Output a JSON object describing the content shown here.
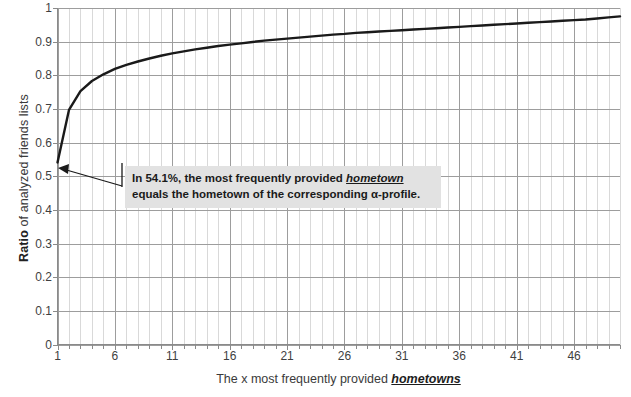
{
  "chart_data": {
    "type": "line",
    "title": "",
    "xlabel": "The x most frequently provided hometowns",
    "xlabel_plain": "The x most frequently provided ",
    "xlabel_emphasis": "hometowns",
    "ylabel": "Ratio of analyzed friends lists",
    "ylabel_bold": "Ratio",
    "ylabel_rest": " of analyzed friends lists",
    "xlim": [
      1,
      50
    ],
    "ylim": [
      0,
      1
    ],
    "grid": true,
    "legend": "none",
    "line_color": "#1a1a1a",
    "grid_color": "#9d9d9d",
    "minor_grid_color": "#c9c9c9",
    "x_ticks": [
      1,
      6,
      11,
      16,
      21,
      26,
      31,
      36,
      41,
      46
    ],
    "x_tick_labels": [
      "1",
      "6",
      "11",
      "16",
      "21",
      "26",
      "31",
      "36",
      "41",
      "46"
    ],
    "y_ticks": [
      0,
      0.1,
      0.2,
      0.3,
      0.4,
      0.5,
      0.6,
      0.7,
      0.8,
      0.9,
      1
    ],
    "y_tick_labels": [
      "0",
      "0.1",
      "0.2",
      "0.3",
      "0.4",
      "0.5",
      "0.6",
      "0.7",
      "0.8",
      "0.9",
      "1"
    ],
    "x": [
      1,
      2,
      3,
      4,
      5,
      6,
      7,
      8,
      9,
      10,
      11,
      12,
      13,
      14,
      15,
      16,
      17,
      18,
      19,
      20,
      21,
      22,
      23,
      24,
      25,
      26,
      27,
      28,
      29,
      30,
      31,
      32,
      33,
      34,
      35,
      36,
      37,
      38,
      39,
      40,
      41,
      42,
      43,
      44,
      45,
      46,
      47,
      48,
      49,
      50
    ],
    "values": [
      0.541,
      0.697,
      0.753,
      0.783,
      0.803,
      0.819,
      0.831,
      0.841,
      0.85,
      0.858,
      0.865,
      0.871,
      0.877,
      0.882,
      0.887,
      0.891,
      0.895,
      0.899,
      0.903,
      0.906,
      0.909,
      0.912,
      0.915,
      0.918,
      0.921,
      0.923,
      0.926,
      0.928,
      0.93,
      0.932,
      0.934,
      0.936,
      0.938,
      0.94,
      0.942,
      0.944,
      0.946,
      0.948,
      0.95,
      0.952,
      0.954,
      0.956,
      0.958,
      0.96,
      0.962,
      0.964,
      0.966,
      0.969,
      0.972,
      0.975
    ],
    "series": [
      {
        "name": "Ratio of analyzed friends lists",
        "values": [
          0.541,
          0.697,
          0.753,
          0.783,
          0.803,
          0.819,
          0.831,
          0.841,
          0.85,
          0.858,
          0.865,
          0.871,
          0.877,
          0.882,
          0.887,
          0.891,
          0.895,
          0.899,
          0.903,
          0.906,
          0.909,
          0.912,
          0.915,
          0.918,
          0.921,
          0.923,
          0.926,
          0.928,
          0.93,
          0.932,
          0.934,
          0.936,
          0.938,
          0.94,
          0.942,
          0.944,
          0.946,
          0.948,
          0.95,
          0.952,
          0.954,
          0.956,
          0.958,
          0.96,
          0.962,
          0.964,
          0.966,
          0.969,
          0.972,
          0.975
        ]
      }
    ],
    "annotations": [
      {
        "text": "In 54.1%, the most frequently provided hometown equals the hometown of the corresponding α-profile.",
        "line1_plain": "In 54.1%, the most frequently provided ",
        "line1_emphasis": "hometown",
        "line2": "equals the hometown of the corresponding α-profile.",
        "points_to_x": 1,
        "points_to_y": 0.541,
        "background": "#e2e2e2"
      }
    ]
  }
}
